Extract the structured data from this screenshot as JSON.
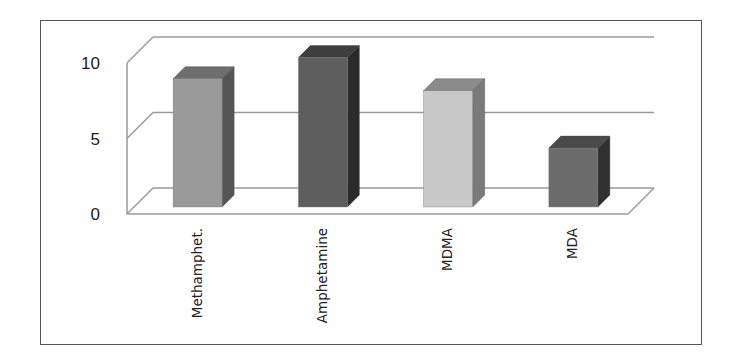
{
  "chart_data": {
    "type": "bar",
    "style": "3d-column",
    "title": "",
    "xlabel": "",
    "ylabel": "",
    "categories": [
      "Methamphet.",
      "Amphetamine",
      "MDMA",
      "MDA"
    ],
    "values": [
      8.5,
      9.9,
      7.7,
      3.9
    ],
    "ylim": [
      0,
      10
    ],
    "yticks": [
      0,
      5,
      10
    ],
    "ytick_labels": [
      "0",
      "5",
      "10"
    ],
    "grid": true,
    "legend": null,
    "bar_colors": [
      "#9a9a9a",
      "#5e5e5e",
      "#c8c8c8",
      "#6c6c6c"
    ],
    "bar_side_colors": [
      "#555555",
      "#2a2a2a",
      "#7a7a7a",
      "#303030"
    ],
    "bar_top_colors": [
      "#6e6e6e",
      "#3e3e3e",
      "#8a8a8a",
      "#4a4a4a"
    ],
    "grid_color": "#9a9a9a"
  }
}
